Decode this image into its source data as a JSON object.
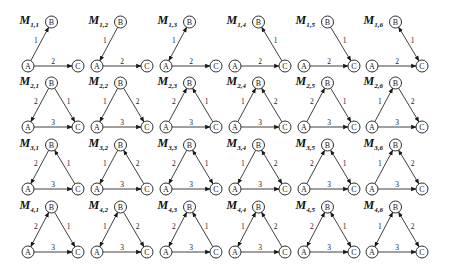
{
  "figure": {
    "rows": 4,
    "cols": 6,
    "nodes": [
      "A",
      "B",
      "C"
    ],
    "motifs": [
      {
        "id": "M1,1",
        "main": "M",
        "sub": "1,1",
        "edges": [
          {
            "from": "A",
            "to": "B",
            "dir": "forward",
            "label": "1"
          },
          {
            "from": "A",
            "to": "C",
            "dir": "forward",
            "label": "2"
          }
        ]
      },
      {
        "id": "M1,2",
        "main": "M",
        "sub": "1,2",
        "edges": [
          {
            "from": "A",
            "to": "B",
            "dir": "backward",
            "label": "1"
          },
          {
            "from": "A",
            "to": "C",
            "dir": "forward",
            "label": "2"
          }
        ]
      },
      {
        "id": "M1,3",
        "main": "M",
        "sub": "1,3",
        "edges": [
          {
            "from": "A",
            "to": "B",
            "dir": "both",
            "label": "1"
          },
          {
            "from": "A",
            "to": "C",
            "dir": "forward",
            "label": "2"
          }
        ]
      },
      {
        "id": "M1,4",
        "main": "M",
        "sub": "1,4",
        "edges": [
          {
            "from": "C",
            "to": "B",
            "dir": "forward",
            "label": "1"
          },
          {
            "from": "A",
            "to": "C",
            "dir": "forward",
            "label": "2"
          }
        ]
      },
      {
        "id": "M1,5",
        "main": "M",
        "sub": "1,5",
        "edges": [
          {
            "from": "C",
            "to": "B",
            "dir": "backward",
            "label": "1"
          },
          {
            "from": "A",
            "to": "C",
            "dir": "forward",
            "label": "2"
          }
        ]
      },
      {
        "id": "M1,6",
        "main": "M",
        "sub": "1,6",
        "edges": [
          {
            "from": "C",
            "to": "B",
            "dir": "both",
            "label": "1"
          },
          {
            "from": "A",
            "to": "C",
            "dir": "forward",
            "label": "2"
          }
        ]
      },
      {
        "id": "M2,1",
        "main": "M",
        "sub": "2,1",
        "edges": [
          {
            "from": "A",
            "to": "B",
            "dir": "backward",
            "label": "2"
          },
          {
            "from": "C",
            "to": "B",
            "dir": "backward",
            "label": "1"
          },
          {
            "from": "A",
            "to": "C",
            "dir": "forward",
            "label": "3"
          }
        ]
      },
      {
        "id": "M2,2",
        "main": "M",
        "sub": "2,2",
        "edges": [
          {
            "from": "A",
            "to": "B",
            "dir": "backward",
            "label": "1"
          },
          {
            "from": "C",
            "to": "B",
            "dir": "backward",
            "label": "2"
          },
          {
            "from": "A",
            "to": "C",
            "dir": "forward",
            "label": "3"
          }
        ]
      },
      {
        "id": "M2,3",
        "main": "M",
        "sub": "2,3",
        "edges": [
          {
            "from": "A",
            "to": "B",
            "dir": "forward",
            "label": "2"
          },
          {
            "from": "C",
            "to": "B",
            "dir": "forward",
            "label": "1"
          },
          {
            "from": "A",
            "to": "C",
            "dir": "forward",
            "label": "3"
          }
        ]
      },
      {
        "id": "M2,4",
        "main": "M",
        "sub": "2,4",
        "edges": [
          {
            "from": "A",
            "to": "B",
            "dir": "forward",
            "label": "1"
          },
          {
            "from": "C",
            "to": "B",
            "dir": "forward",
            "label": "2"
          },
          {
            "from": "A",
            "to": "C",
            "dir": "forward",
            "label": "3"
          }
        ]
      },
      {
        "id": "M2,5",
        "main": "M",
        "sub": "2,5",
        "edges": [
          {
            "from": "A",
            "to": "B",
            "dir": "forward",
            "label": "2"
          },
          {
            "from": "C",
            "to": "B",
            "dir": "backward",
            "label": "1"
          },
          {
            "from": "A",
            "to": "C",
            "dir": "forward",
            "label": "3"
          }
        ]
      },
      {
        "id": "M2,6",
        "main": "M",
        "sub": "2,6",
        "edges": [
          {
            "from": "A",
            "to": "B",
            "dir": "forward",
            "label": "1"
          },
          {
            "from": "C",
            "to": "B",
            "dir": "backward",
            "label": "2"
          },
          {
            "from": "A",
            "to": "C",
            "dir": "forward",
            "label": "3"
          }
        ]
      },
      {
        "id": "M3,1",
        "main": "M",
        "sub": "3,1",
        "edges": [
          {
            "from": "A",
            "to": "B",
            "dir": "backward",
            "label": "2"
          },
          {
            "from": "C",
            "to": "B",
            "dir": "forward",
            "label": "1"
          },
          {
            "from": "A",
            "to": "C",
            "dir": "forward",
            "label": "3"
          }
        ]
      },
      {
        "id": "M3,2",
        "main": "M",
        "sub": "3,2",
        "edges": [
          {
            "from": "A",
            "to": "B",
            "dir": "backward",
            "label": "1"
          },
          {
            "from": "C",
            "to": "B",
            "dir": "forward",
            "label": "2"
          },
          {
            "from": "A",
            "to": "C",
            "dir": "forward",
            "label": "3"
          }
        ]
      },
      {
        "id": "M3,3",
        "main": "M",
        "sub": "3,3",
        "edges": [
          {
            "from": "A",
            "to": "B",
            "dir": "backward",
            "label": "2"
          },
          {
            "from": "C",
            "to": "B",
            "dir": "both",
            "label": "1"
          },
          {
            "from": "A",
            "to": "C",
            "dir": "forward",
            "label": "3"
          }
        ]
      },
      {
        "id": "M3,4",
        "main": "M",
        "sub": "3,4",
        "edges": [
          {
            "from": "A",
            "to": "B",
            "dir": "backward",
            "label": "1"
          },
          {
            "from": "C",
            "to": "B",
            "dir": "both",
            "label": "2"
          },
          {
            "from": "A",
            "to": "C",
            "dir": "forward",
            "label": "3"
          }
        ]
      },
      {
        "id": "M3,5",
        "main": "M",
        "sub": "3,5",
        "edges": [
          {
            "from": "A",
            "to": "B",
            "dir": "forward",
            "label": "2"
          },
          {
            "from": "C",
            "to": "B",
            "dir": "both",
            "label": "1"
          },
          {
            "from": "A",
            "to": "C",
            "dir": "forward",
            "label": "3"
          }
        ]
      },
      {
        "id": "M3,6",
        "main": "M",
        "sub": "3,6",
        "edges": [
          {
            "from": "A",
            "to": "B",
            "dir": "forward",
            "label": "1"
          },
          {
            "from": "C",
            "to": "B",
            "dir": "both",
            "label": "2"
          },
          {
            "from": "A",
            "to": "C",
            "dir": "forward",
            "label": "3"
          }
        ]
      },
      {
        "id": "M4,1",
        "main": "M",
        "sub": "4,1",
        "edges": [
          {
            "from": "A",
            "to": "B",
            "dir": "both",
            "label": "2"
          },
          {
            "from": "C",
            "to": "B",
            "dir": "backward",
            "label": "1"
          },
          {
            "from": "A",
            "to": "C",
            "dir": "forward",
            "label": "3"
          }
        ]
      },
      {
        "id": "M4,2",
        "main": "M",
        "sub": "4,2",
        "edges": [
          {
            "from": "A",
            "to": "B",
            "dir": "both",
            "label": "1"
          },
          {
            "from": "C",
            "to": "B",
            "dir": "backward",
            "label": "2"
          },
          {
            "from": "A",
            "to": "C",
            "dir": "forward",
            "label": "3"
          }
        ]
      },
      {
        "id": "M4,3",
        "main": "M",
        "sub": "4,3",
        "edges": [
          {
            "from": "A",
            "to": "B",
            "dir": "both",
            "label": "2"
          },
          {
            "from": "C",
            "to": "B",
            "dir": "forward",
            "label": "1"
          },
          {
            "from": "A",
            "to": "C",
            "dir": "forward",
            "label": "3"
          }
        ]
      },
      {
        "id": "M4,4",
        "main": "M",
        "sub": "4,4",
        "edges": [
          {
            "from": "A",
            "to": "B",
            "dir": "both",
            "label": "1"
          },
          {
            "from": "C",
            "to": "B",
            "dir": "forward",
            "label": "2"
          },
          {
            "from": "A",
            "to": "C",
            "dir": "forward",
            "label": "3"
          }
        ]
      },
      {
        "id": "M4,5",
        "main": "M",
        "sub": "4,5",
        "edges": [
          {
            "from": "A",
            "to": "B",
            "dir": "both",
            "label": "2"
          },
          {
            "from": "C",
            "to": "B",
            "dir": "both",
            "label": "1"
          },
          {
            "from": "A",
            "to": "C",
            "dir": "forward",
            "label": "3"
          }
        ]
      },
      {
        "id": "M4,6",
        "main": "M",
        "sub": "4,6",
        "edges": [
          {
            "from": "A",
            "to": "B",
            "dir": "both",
            "label": "1"
          },
          {
            "from": "C",
            "to": "B",
            "dir": "both",
            "label": "2"
          },
          {
            "from": "A",
            "to": "C",
            "dir": "forward",
            "label": "3"
          }
        ]
      }
    ]
  },
  "colors": {
    "stroke": "#1a1a1a",
    "background": "#ffffff"
  }
}
